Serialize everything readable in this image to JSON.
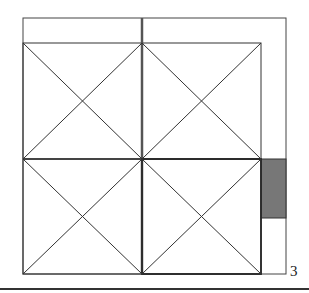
{
  "figure": {
    "label": "3",
    "colors": {
      "line": "#333333",
      "thick_line": "#2a2a2a",
      "shaded": "#777777"
    },
    "outer_frame": {
      "x": 23,
      "y": 18,
      "w": 263,
      "h": 256
    },
    "grid": {
      "x": 23,
      "y": 43,
      "w": 238,
      "h": 231,
      "center_x": 142,
      "center_y": 159,
      "cells": [
        {
          "name": "top-left",
          "diagonals": true
        },
        {
          "name": "top-right",
          "diagonals": true
        },
        {
          "name": "bottom-left",
          "diagonals": true
        },
        {
          "name": "bottom-right",
          "diagonals": true
        }
      ]
    },
    "shaded_rect": {
      "x": 261,
      "y": 159,
      "w": 25,
      "h": 59
    }
  }
}
